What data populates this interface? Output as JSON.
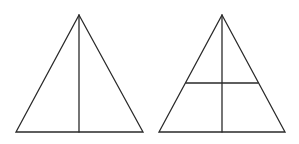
{
  "diagram": {
    "background": "#ffffff",
    "stroke_color": "#2a2a2a",
    "figures": [
      {
        "name": "left-triangle",
        "vertices": [
          [
            79,
            15
          ],
          [
            16,
            132
          ],
          [
            143,
            132
          ]
        ],
        "segments": [
          {
            "name": "median",
            "from": [
              79,
              15
            ],
            "to": [
              79,
              132
            ]
          }
        ]
      },
      {
        "name": "right-triangle",
        "vertices": [
          [
            222,
            15
          ],
          [
            159,
            132
          ],
          [
            285,
            132
          ]
        ],
        "segments": [
          {
            "name": "median",
            "from": [
              222,
              15
            ],
            "to": [
              222,
              132
            ]
          },
          {
            "name": "midline",
            "from": [
              186,
              83
            ],
            "to": [
              258,
              83
            ]
          }
        ]
      }
    ]
  }
}
